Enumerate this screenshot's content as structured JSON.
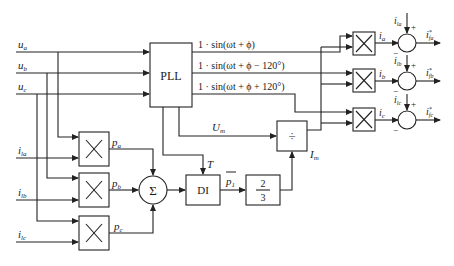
{
  "diagram": {
    "inputs": {
      "voltages": [
        {
          "name": "u",
          "sub": "a"
        },
        {
          "name": "u",
          "sub": "b"
        },
        {
          "name": "u",
          "sub": "c"
        }
      ],
      "currents": [
        {
          "name": "i",
          "sub": "la"
        },
        {
          "name": "i",
          "sub": "lb"
        },
        {
          "name": "i",
          "sub": "lc"
        }
      ]
    },
    "blocks": {
      "pll": "PLL",
      "sum": "Σ",
      "di": "DI",
      "gain_num": "2",
      "gain_den": "3",
      "divide": "÷"
    },
    "pll_outputs": [
      "1 · sin(ωt + ϕ)",
      "1 · sin(ωt + ϕ − 120°)",
      "1 · sin(ωt + ϕ + 120°)"
    ],
    "signals": {
      "um": {
        "name": "U",
        "sub": "m"
      },
      "im": {
        "name": "I",
        "sub": "m"
      },
      "t": "T",
      "p1": {
        "name": "p",
        "sub": "1"
      },
      "powers": [
        {
          "name": "p",
          "sub": "a"
        },
        {
          "name": "p",
          "sub": "b"
        },
        {
          "name": "p",
          "sub": "c"
        }
      ],
      "phase_currents": [
        {
          "name": "i",
          "sub": "a"
        },
        {
          "name": "i",
          "sub": "b"
        },
        {
          "name": "i",
          "sub": "c"
        }
      ],
      "load_currents_right": [
        {
          "name": "i",
          "sub": "la"
        },
        {
          "name": "i",
          "sub": "lb"
        },
        {
          "name": "i",
          "sub": "lc"
        }
      ],
      "outputs": [
        {
          "name": "i",
          "sub": "fa",
          "sup": "*"
        },
        {
          "name": "i",
          "sub": "fb",
          "sup": "*"
        },
        {
          "name": "i",
          "sub": "fc",
          "sup": "*"
        }
      ],
      "plus": "+",
      "minus": "−"
    }
  }
}
